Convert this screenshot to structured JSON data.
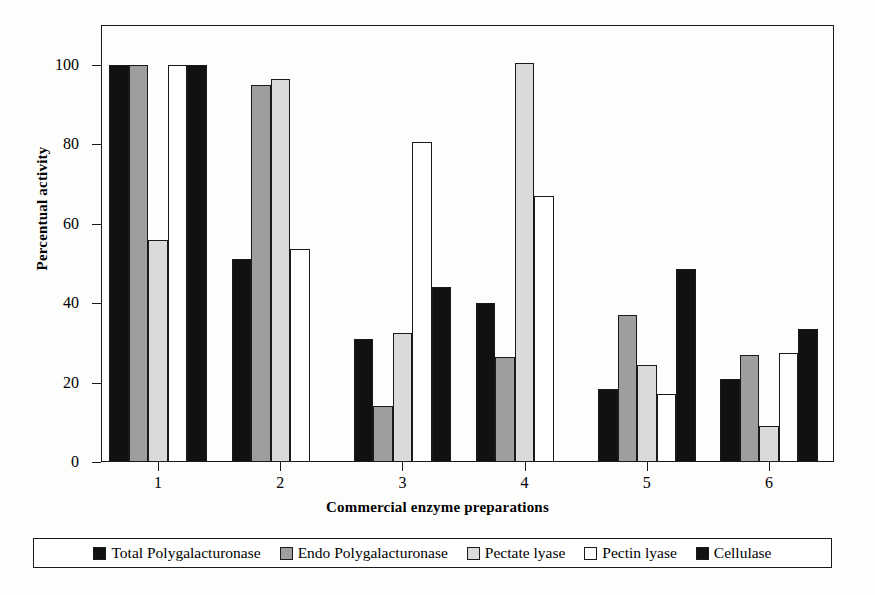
{
  "chart_data": {
    "type": "bar",
    "title": "",
    "xlabel": "Commercial enzyme preparations",
    "ylabel": "Percentual activity",
    "categories": [
      "1",
      "2",
      "3",
      "4",
      "5",
      "6"
    ],
    "ylim": [
      0,
      110
    ],
    "yticks": [
      0,
      20,
      40,
      60,
      80,
      100
    ],
    "ytick_labels": [
      "0",
      "20",
      "40",
      "60",
      "80",
      "100"
    ],
    "grid": false,
    "legend_position": "bottom",
    "series": [
      {
        "name": "Total Polygalacturonase",
        "color": "#111111",
        "values": [
          100,
          51,
          31,
          40,
          18.5,
          21
        ]
      },
      {
        "name": "Endo Polygalacturonase",
        "color": "#9e9e9e",
        "values": [
          100,
          95,
          14,
          26.5,
          37,
          27
        ]
      },
      {
        "name": "Pectate lyase",
        "color": "#dadada",
        "values": [
          56,
          96.5,
          32.5,
          100.5,
          24.5,
          9
        ]
      },
      {
        "name": "Pectin lyase",
        "color": "#ffffff",
        "values": [
          100,
          53.5,
          80.5,
          67,
          17,
          27.5
        ]
      },
      {
        "name": "Cellulase",
        "color": "#111111",
        "values": [
          100,
          null,
          44,
          null,
          48.5,
          33.5
        ]
      }
    ]
  }
}
